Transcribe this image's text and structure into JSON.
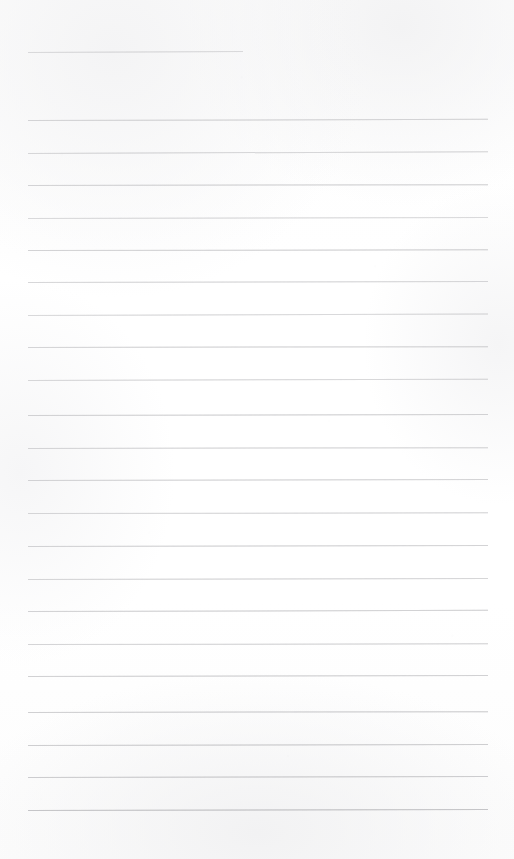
{
  "page": {
    "kind": "scanned-ruled-paper",
    "width_px": 514,
    "height_px": 859,
    "background_color": "#fdfdfd",
    "rule_color": "#9a9a9e",
    "text_content": "",
    "has_handwriting": false,
    "has_printed_text": false
  },
  "ruling": {
    "left_margin_px": 28,
    "right_edge_px": 488,
    "line_spacing_px": 32.4,
    "line_count": 23,
    "first_line_is_short": true,
    "short_line_right_edge_px": 243
  },
  "lines": [
    {
      "label": "line-1",
      "y": 52.0,
      "x1": 28,
      "x2": 243,
      "tilt_deg": -0.25,
      "opacity": 0.52,
      "thickness": 1
    },
    {
      "label": "line-2",
      "y": 120.0,
      "x1": 28,
      "x2": 488,
      "tilt_deg": -0.15,
      "opacity": 0.62,
      "thickness": 1
    },
    {
      "label": "line-3",
      "y": 152.5,
      "x1": 28,
      "x2": 488,
      "tilt_deg": -0.22,
      "opacity": 0.58,
      "thickness": 1
    },
    {
      "label": "line-4",
      "y": 185.0,
      "x1": 28,
      "x2": 488,
      "tilt_deg": -0.1,
      "opacity": 0.64,
      "thickness": 1
    },
    {
      "label": "line-5",
      "y": 217.5,
      "x1": 28,
      "x2": 488,
      "tilt_deg": -0.12,
      "opacity": 0.55,
      "thickness": 1
    },
    {
      "label": "line-6",
      "y": 250.0,
      "x1": 28,
      "x2": 488,
      "tilt_deg": -0.08,
      "opacity": 0.66,
      "thickness": 1
    },
    {
      "label": "line-7",
      "y": 282.0,
      "x1": 28,
      "x2": 488,
      "tilt_deg": -0.14,
      "opacity": 0.6,
      "thickness": 1
    },
    {
      "label": "line-8",
      "y": 314.5,
      "x1": 28,
      "x2": 488,
      "tilt_deg": -0.18,
      "opacity": 0.57,
      "thickness": 1
    },
    {
      "label": "line-9",
      "y": 347.0,
      "x1": 28,
      "x2": 488,
      "tilt_deg": -0.1,
      "opacity": 0.63,
      "thickness": 1
    },
    {
      "label": "line-10",
      "y": 379.5,
      "x1": 28,
      "x2": 488,
      "tilt_deg": -0.16,
      "opacity": 0.59,
      "thickness": 1
    },
    {
      "label": "line-11",
      "y": 415.0,
      "x1": 28,
      "x2": 488,
      "tilt_deg": -0.12,
      "opacity": 0.66,
      "thickness": 1
    },
    {
      "label": "line-12",
      "y": 447.5,
      "x1": 28,
      "x2": 488,
      "tilt_deg": -0.1,
      "opacity": 0.61,
      "thickness": 1
    },
    {
      "label": "line-13",
      "y": 480.0,
      "x1": 28,
      "x2": 488,
      "tilt_deg": -0.14,
      "opacity": 0.64,
      "thickness": 1
    },
    {
      "label": "line-14",
      "y": 513.0,
      "x1": 28,
      "x2": 488,
      "tilt_deg": -0.09,
      "opacity": 0.6,
      "thickness": 1
    },
    {
      "label": "line-15",
      "y": 546.0,
      "x1": 28,
      "x2": 488,
      "tilt_deg": -0.13,
      "opacity": 0.65,
      "thickness": 1
    },
    {
      "label": "line-16",
      "y": 578.5,
      "x1": 28,
      "x2": 488,
      "tilt_deg": -0.11,
      "opacity": 0.62,
      "thickness": 1
    },
    {
      "label": "line-17",
      "y": 611.0,
      "x1": 28,
      "x2": 488,
      "tilt_deg": -0.15,
      "opacity": 0.67,
      "thickness": 1
    },
    {
      "label": "line-18",
      "y": 643.5,
      "x1": 28,
      "x2": 488,
      "tilt_deg": -0.08,
      "opacity": 0.63,
      "thickness": 1
    },
    {
      "label": "line-19",
      "y": 676.0,
      "x1": 28,
      "x2": 488,
      "tilt_deg": -0.12,
      "opacity": 0.68,
      "thickness": 1
    },
    {
      "label": "line-20",
      "y": 712.0,
      "x1": 28,
      "x2": 488,
      "tilt_deg": -0.1,
      "opacity": 0.7,
      "thickness": 1
    },
    {
      "label": "line-21",
      "y": 744.5,
      "x1": 28,
      "x2": 488,
      "tilt_deg": -0.13,
      "opacity": 0.72,
      "thickness": 1
    },
    {
      "label": "line-22",
      "y": 777.0,
      "x1": 28,
      "x2": 488,
      "tilt_deg": -0.11,
      "opacity": 0.74,
      "thickness": 1
    },
    {
      "label": "line-23",
      "y": 810.0,
      "x1": 28,
      "x2": 488,
      "tilt_deg": -0.14,
      "opacity": 0.86,
      "thickness": 1
    }
  ]
}
